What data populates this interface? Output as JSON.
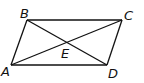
{
  "figure": {
    "type": "parallelogram with diagonals",
    "vertices": [
      "A",
      "B",
      "C",
      "D"
    ],
    "intersection": "E",
    "sides": [
      "AB",
      "BC",
      "CD",
      "DA"
    ],
    "diagonals": [
      "AC",
      "BD"
    ]
  },
  "labels": {
    "A": "A",
    "B": "B",
    "C": "C",
    "D": "D",
    "E": "E"
  }
}
